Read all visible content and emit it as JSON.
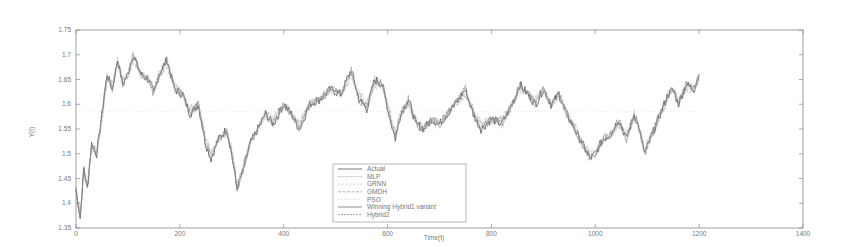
{
  "chart_data": {
    "type": "line",
    "title": "",
    "xlabel": "Time(t)",
    "ylabel": "Y(t)",
    "xlim": [
      0,
      1400
    ],
    "ylim": [
      1.35,
      1.75
    ],
    "grid": false,
    "legend_position": "lower center (inside)",
    "x_ticks": [
      0,
      200,
      400,
      600,
      800,
      1000,
      1200,
      1400
    ],
    "x_tick_labels": [
      "0",
      "200",
      "400",
      "600",
      "800",
      "1000",
      "1200",
      "1400"
    ],
    "y_ticks": [
      1.35,
      1.4,
      1.45,
      1.5,
      1.55,
      1.6,
      1.65,
      1.7,
      1.75
    ],
    "y_tick_labels": [
      "1.35",
      "1.4",
      "1.45",
      "1.5",
      "1.55",
      "1.6",
      "1.65",
      "1.7",
      "1.75"
    ],
    "x": [
      0,
      8,
      15,
      22,
      30,
      40,
      50,
      60,
      70,
      80,
      90,
      100,
      110,
      125,
      140,
      150,
      160,
      175,
      190,
      205,
      220,
      235,
      250,
      260,
      275,
      290,
      300,
      310,
      320,
      335,
      350,
      365,
      380,
      400,
      415,
      430,
      450,
      470,
      490,
      510,
      530,
      545,
      560,
      575,
      590,
      605,
      615,
      625,
      640,
      655,
      670,
      685,
      700,
      715,
      730,
      750,
      765,
      780,
      800,
      820,
      840,
      855,
      870,
      885,
      900,
      915,
      930,
      945,
      960,
      975,
      990,
      1000,
      1015,
      1030,
      1045,
      1060,
      1075,
      1085,
      1095,
      1110,
      1125,
      1140,
      1150,
      1160,
      1175,
      1190,
      1200
    ],
    "series": [
      {
        "name": "Actual",
        "values": [
          1.43,
          1.37,
          1.47,
          1.43,
          1.52,
          1.5,
          1.58,
          1.66,
          1.63,
          1.69,
          1.64,
          1.66,
          1.7,
          1.66,
          1.65,
          1.62,
          1.66,
          1.69,
          1.63,
          1.62,
          1.58,
          1.6,
          1.52,
          1.49,
          1.53,
          1.55,
          1.5,
          1.43,
          1.46,
          1.52,
          1.55,
          1.58,
          1.56,
          1.6,
          1.58,
          1.55,
          1.6,
          1.61,
          1.63,
          1.62,
          1.67,
          1.61,
          1.59,
          1.65,
          1.64,
          1.57,
          1.53,
          1.58,
          1.61,
          1.56,
          1.55,
          1.57,
          1.56,
          1.58,
          1.6,
          1.63,
          1.58,
          1.55,
          1.57,
          1.56,
          1.6,
          1.64,
          1.62,
          1.6,
          1.63,
          1.6,
          1.62,
          1.58,
          1.55,
          1.52,
          1.49,
          1.5,
          1.53,
          1.54,
          1.57,
          1.53,
          1.58,
          1.55,
          1.5,
          1.54,
          1.58,
          1.62,
          1.63,
          1.6,
          1.64,
          1.63,
          1.66
        ]
      },
      {
        "name": "MLP",
        "values": [
          1.43,
          1.38,
          1.46,
          1.44,
          1.51,
          1.51,
          1.57,
          1.65,
          1.64,
          1.68,
          1.65,
          1.66,
          1.69,
          1.66,
          1.65,
          1.63,
          1.66,
          1.68,
          1.64,
          1.62,
          1.59,
          1.6,
          1.53,
          1.5,
          1.53,
          1.54,
          1.51,
          1.44,
          1.47,
          1.52,
          1.55,
          1.58,
          1.57,
          1.6,
          1.58,
          1.56,
          1.6,
          1.61,
          1.63,
          1.62,
          1.66,
          1.62,
          1.6,
          1.64,
          1.64,
          1.58,
          1.54,
          1.58,
          1.6,
          1.57,
          1.55,
          1.57,
          1.56,
          1.58,
          1.6,
          1.62,
          1.59,
          1.56,
          1.57,
          1.57,
          1.6,
          1.63,
          1.62,
          1.61,
          1.63,
          1.6,
          1.62,
          1.58,
          1.56,
          1.52,
          1.5,
          1.5,
          1.53,
          1.54,
          1.56,
          1.54,
          1.57,
          1.55,
          1.51,
          1.54,
          1.58,
          1.61,
          1.63,
          1.61,
          1.63,
          1.63,
          1.65
        ]
      },
      {
        "name": "GRNN",
        "values": [
          1.44,
          1.38,
          1.46,
          1.44,
          1.51,
          1.51,
          1.57,
          1.65,
          1.63,
          1.68,
          1.65,
          1.66,
          1.69,
          1.66,
          1.65,
          1.63,
          1.66,
          1.68,
          1.64,
          1.62,
          1.59,
          1.6,
          1.53,
          1.5,
          1.53,
          1.54,
          1.51,
          1.44,
          1.46,
          1.52,
          1.55,
          1.58,
          1.57,
          1.6,
          1.58,
          1.56,
          1.6,
          1.61,
          1.63,
          1.62,
          1.66,
          1.62,
          1.6,
          1.64,
          1.64,
          1.58,
          1.54,
          1.58,
          1.6,
          1.57,
          1.55,
          1.57,
          1.56,
          1.58,
          1.6,
          1.62,
          1.59,
          1.56,
          1.57,
          1.57,
          1.6,
          1.63,
          1.62,
          1.61,
          1.63,
          1.6,
          1.62,
          1.58,
          1.56,
          1.52,
          1.5,
          1.5,
          1.53,
          1.54,
          1.56,
          1.54,
          1.57,
          1.55,
          1.51,
          1.54,
          1.58,
          1.61,
          1.63,
          1.61,
          1.63,
          1.63,
          1.65
        ]
      },
      {
        "name": "GMDH",
        "values": [
          1.43,
          1.38,
          1.46,
          1.44,
          1.51,
          1.51,
          1.57,
          1.65,
          1.64,
          1.68,
          1.65,
          1.66,
          1.69,
          1.66,
          1.65,
          1.63,
          1.66,
          1.68,
          1.64,
          1.62,
          1.59,
          1.6,
          1.53,
          1.5,
          1.53,
          1.54,
          1.51,
          1.44,
          1.47,
          1.52,
          1.55,
          1.58,
          1.57,
          1.6,
          1.58,
          1.56,
          1.6,
          1.61,
          1.63,
          1.62,
          1.66,
          1.62,
          1.6,
          1.64,
          1.64,
          1.58,
          1.54,
          1.58,
          1.6,
          1.57,
          1.55,
          1.57,
          1.56,
          1.58,
          1.6,
          1.62,
          1.59,
          1.56,
          1.57,
          1.57,
          1.6,
          1.63,
          1.62,
          1.61,
          1.63,
          1.6,
          1.62,
          1.58,
          1.56,
          1.52,
          1.5,
          1.5,
          1.53,
          1.54,
          1.56,
          1.54,
          1.57,
          1.55,
          1.51,
          1.54,
          1.58,
          1.61,
          1.63,
          1.61,
          1.63,
          1.63,
          1.65
        ]
      },
      {
        "name": "PSO",
        "values": [
          1.585,
          1.585,
          1.585,
          1.585,
          1.585,
          1.585,
          1.585,
          1.585,
          1.585,
          1.585,
          1.585,
          1.585,
          1.585,
          1.585,
          1.585,
          1.585,
          1.585,
          1.585,
          1.585,
          1.585,
          1.585,
          1.585,
          1.585,
          1.585,
          1.585,
          1.585,
          1.585,
          1.585,
          1.585,
          1.585,
          1.585,
          1.585,
          1.585,
          1.585,
          1.585,
          1.585,
          1.585,
          1.585,
          1.585,
          1.585,
          1.585,
          1.585,
          1.585,
          1.585,
          1.585,
          1.585,
          1.585,
          1.585,
          1.585,
          1.585,
          1.585,
          1.585,
          1.585,
          1.585,
          1.585,
          1.585,
          1.585,
          1.585,
          1.585,
          1.585,
          1.585,
          1.585,
          1.585,
          1.585,
          1.585,
          1.585,
          1.585,
          1.585,
          1.585,
          1.585,
          1.585,
          1.585,
          1.585,
          1.585,
          1.585,
          1.585,
          1.585,
          1.585,
          1.585,
          1.585,
          1.585,
          1.585,
          1.585,
          1.585,
          1.585,
          1.585,
          1.585
        ]
      },
      {
        "name": "Winning Hybrid1 variant",
        "values": [
          1.43,
          1.37,
          1.47,
          1.43,
          1.52,
          1.5,
          1.58,
          1.66,
          1.63,
          1.69,
          1.64,
          1.66,
          1.7,
          1.66,
          1.65,
          1.62,
          1.66,
          1.69,
          1.63,
          1.62,
          1.58,
          1.6,
          1.52,
          1.49,
          1.53,
          1.55,
          1.5,
          1.43,
          1.46,
          1.52,
          1.55,
          1.58,
          1.56,
          1.6,
          1.58,
          1.55,
          1.6,
          1.61,
          1.63,
          1.62,
          1.67,
          1.61,
          1.59,
          1.65,
          1.64,
          1.57,
          1.53,
          1.58,
          1.61,
          1.56,
          1.55,
          1.57,
          1.56,
          1.58,
          1.6,
          1.63,
          1.58,
          1.55,
          1.57,
          1.56,
          1.6,
          1.64,
          1.62,
          1.6,
          1.63,
          1.6,
          1.62,
          1.58,
          1.55,
          1.52,
          1.49,
          1.5,
          1.53,
          1.54,
          1.57,
          1.53,
          1.58,
          1.55,
          1.5,
          1.54,
          1.58,
          1.62,
          1.63,
          1.6,
          1.64,
          1.63,
          1.66
        ]
      },
      {
        "name": "Hybrid2",
        "values": [
          1.43,
          1.37,
          1.47,
          1.43,
          1.52,
          1.5,
          1.58,
          1.66,
          1.63,
          1.69,
          1.64,
          1.66,
          1.7,
          1.66,
          1.65,
          1.62,
          1.66,
          1.69,
          1.63,
          1.62,
          1.58,
          1.6,
          1.52,
          1.49,
          1.53,
          1.55,
          1.5,
          1.43,
          1.46,
          1.52,
          1.55,
          1.58,
          1.56,
          1.6,
          1.58,
          1.55,
          1.6,
          1.61,
          1.63,
          1.62,
          1.67,
          1.61,
          1.59,
          1.65,
          1.64,
          1.57,
          1.53,
          1.58,
          1.61,
          1.56,
          1.55,
          1.57,
          1.56,
          1.58,
          1.6,
          1.63,
          1.58,
          1.55,
          1.57,
          1.56,
          1.6,
          1.64,
          1.62,
          1.6,
          1.63,
          1.6,
          1.62,
          1.58,
          1.55,
          1.52,
          1.49,
          1.5,
          1.53,
          1.54,
          1.57,
          1.53,
          1.58,
          1.55,
          1.5,
          1.54,
          1.58,
          1.62,
          1.63,
          1.6,
          1.64,
          1.63,
          1.66
        ]
      }
    ],
    "legend": [
      "Actual",
      "MLP",
      "GRNN",
      "GMDH",
      "PSO",
      "Winning Hybrid1 variant",
      "Hybrid2"
    ],
    "series_colors": [
      "#555555",
      "#aaaaaa",
      "#bbbbbb",
      "#999999",
      "#cccccc",
      "#777777",
      "#888888"
    ]
  }
}
